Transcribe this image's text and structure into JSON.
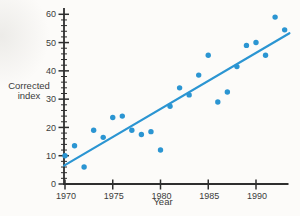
{
  "chart_data": {
    "type": "scatter",
    "title": "",
    "xlabel": "Year",
    "ylabel_lines": [
      "Corrected",
      "index"
    ],
    "x_ticks": [
      1970,
      1975,
      1980,
      1985,
      1990
    ],
    "y_ticks": [
      0,
      10,
      20,
      30,
      40,
      50,
      60
    ],
    "y_minor_step": 2,
    "xlim": [
      1969.9,
      1993.6
    ],
    "ylim": [
      0,
      62
    ],
    "grid": false,
    "legend": "none",
    "points": [
      [
        1970,
        10
      ],
      [
        1971,
        13.5
      ],
      [
        1972,
        6
      ],
      [
        1973,
        19
      ],
      [
        1974,
        16.5
      ],
      [
        1975,
        23.5
      ],
      [
        1976,
        24
      ],
      [
        1977,
        19
      ],
      [
        1978,
        17.5
      ],
      [
        1979,
        18.5
      ],
      [
        1980,
        12
      ],
      [
        1981,
        27.5
      ],
      [
        1982,
        34
      ],
      [
        1983,
        31.5
      ],
      [
        1984,
        38.5
      ],
      [
        1985,
        45.5
      ],
      [
        1986,
        29
      ],
      [
        1987,
        32.5
      ],
      [
        1988,
        41.5
      ],
      [
        1989,
        49
      ],
      [
        1990,
        50
      ],
      [
        1991,
        45.5
      ],
      [
        1992,
        59
      ],
      [
        1993,
        54.5
      ]
    ],
    "trend_line": {
      "x1": 1969.9,
      "y1": 6.5,
      "x2": 1993.5,
      "y2": 53.3
    },
    "point_color": "#2b95d2",
    "line_color": "#2b95d2",
    "axis_color": "#2e2e2e",
    "text_color": "#3b3b3b"
  }
}
